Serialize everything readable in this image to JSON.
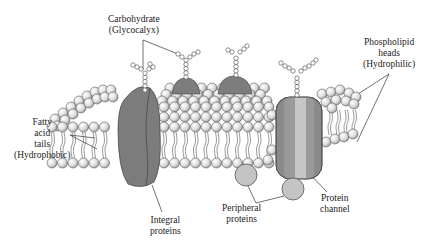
{
  "colors": {
    "background": "#ffffff",
    "protein_dark": "#7a7a7a",
    "protein_mid": "#8c8c8c",
    "channel_light": "#bdbdbd",
    "peripheral": "#c4c4c4",
    "head_fill": "#e8e8e8",
    "outline": "#333333",
    "text": "#222222"
  },
  "labels": {
    "carbohydrate": {
      "line1": "Carbohydrate",
      "line2": "(Glycocalyx)"
    },
    "phospholipid": {
      "line1": "Phospholipid",
      "line2": "heads",
      "line3": "(Hydrophilic)"
    },
    "fatty_acid": {
      "line1": "Fatty",
      "line2": "acid",
      "line3": "tails",
      "line4": "(Hydrophobic)"
    },
    "integral": {
      "line1": "Integral",
      "line2": "proteins"
    },
    "peripheral": {
      "line1": "Peripheral",
      "line2": "proteins"
    },
    "channel": {
      "line1": "Protein",
      "line2": "channel"
    }
  }
}
